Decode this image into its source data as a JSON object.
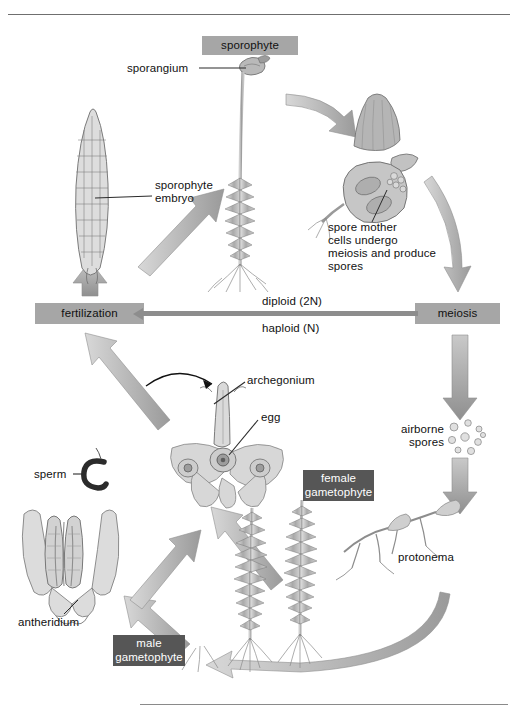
{
  "figure": {
    "background": "#ffffff",
    "chip_color": "#a6a6a6",
    "chip_dark_color": "#565656",
    "arrow_color": "#a8a8a8",
    "leader_color": "#2b2b2b"
  },
  "chips": [
    {
      "id": "sporophyte",
      "label": "sporophyte"
    },
    {
      "id": "fertilization",
      "label": "fertilization"
    },
    {
      "id": "meiosis",
      "label": "meiosis"
    },
    {
      "id": "female_gametophyte",
      "line1": "female",
      "line2": "gametophyte"
    },
    {
      "id": "male_gametophyte",
      "line1": "male",
      "line2": "gametophyte"
    }
  ],
  "labels": {
    "sporangium": "sporangium",
    "sporophyte_embryo_l1": "sporophyte",
    "sporophyte_embryo_l2": "embryo",
    "spore_mother_l1": "spore mother",
    "spore_mother_l2": "cells undergo",
    "spore_mother_l3": "meiosis and produce",
    "spore_mother_l4": "spores",
    "diploid": "diploid (2N)",
    "haploid": "haploid (N)",
    "archegonium": "archegonium",
    "egg": "egg",
    "sperm": "sperm",
    "airborne_l1": "airborne",
    "airborne_l2": "spores",
    "protonema": "protonema",
    "antheridium": "antheridium"
  },
  "diagram_stages": [
    "sporophyte embryo",
    "sporophyte with sporangium",
    "sporangium cap and spore mother cells",
    "meiosis",
    "airborne spores",
    "protonema",
    "male gametophyte",
    "female gametophyte",
    "antheridium releasing sperm",
    "archegonium containing egg",
    "fertilization"
  ]
}
